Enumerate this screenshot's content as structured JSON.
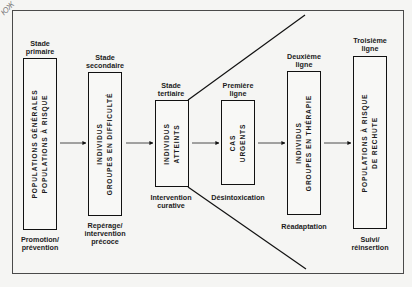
{
  "corner_mark": "ЮЖ",
  "stages": [
    {
      "id": "primaire",
      "title": [
        "Stade",
        "primaire"
      ],
      "box_lines": [
        "POPULATIONS GÉNÉRALES",
        "POPULATIONS À RISQUE"
      ],
      "caption": [
        "Promotion/",
        "prévention"
      ]
    },
    {
      "id": "secondaire",
      "title": [
        "Stade",
        "secondaire"
      ],
      "box_lines": [
        "INDIVIDUS",
        "GROUPES EN DIFFICULTÉ"
      ],
      "caption": [
        "Repérage/",
        "intervention",
        "précoce"
      ]
    },
    {
      "id": "tertiaire",
      "title": [
        "Stade",
        "tertiaire"
      ],
      "box_lines": [
        "INDIVIDUS",
        "ATTEINTS"
      ],
      "caption": [
        "Intervention",
        "curative"
      ]
    },
    {
      "id": "premiere-ligne",
      "title": [
        "Première",
        "ligne"
      ],
      "box_lines": [
        "CAS",
        "URGENTS"
      ],
      "caption": [
        "Désintoxication"
      ]
    },
    {
      "id": "deuxieme-ligne",
      "title": [
        "Deuxième",
        "ligne"
      ],
      "box_lines": [
        "INDIVIDUS",
        "GROUPES EN THÉRAPIE"
      ],
      "caption": [
        "Réadaptation"
      ]
    },
    {
      "id": "troisieme-ligne",
      "title": [
        "Troisième",
        "ligne"
      ],
      "box_lines": [
        "POPULATIONS À RISQUE",
        "DE RECHUTE"
      ],
      "caption": [
        "Suivi/",
        "réinsertion"
      ]
    }
  ],
  "colors": {
    "line": "#111111",
    "frame": "#4a4a4a",
    "background": "#f5f5f3"
  }
}
